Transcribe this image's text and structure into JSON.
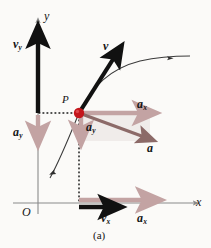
{
  "figure": {
    "caption": "(a)",
    "background_color": "#fbfaf8",
    "width": 211,
    "height": 248
  },
  "colors": {
    "axis": "#8a8a8a",
    "velocity_vector": "#111111",
    "acceleration_component": "#c3a3a3",
    "acceleration_resultant": "#8c6a68",
    "point_marker": "#c4161c",
    "shaded_region": "#f0ecea",
    "trajectory": "#3a3a3a",
    "dotted_guide": "#1a1a1a",
    "label_text": "#141414"
  },
  "axes": {
    "x_label": "x",
    "y_label": "y",
    "origin_label": "O"
  },
  "point": {
    "label": "P",
    "marker_name": "particle-position-dot"
  },
  "vectors": {
    "v": {
      "label": "v",
      "description": "velocity vector at P",
      "color": "#111111"
    },
    "v_y": {
      "label": "v",
      "subscript": "y",
      "description": "y component of velocity on y-axis",
      "color": "#111111"
    },
    "v_x": {
      "label": "v",
      "subscript": "x",
      "description": "x component of velocity on x-axis",
      "color": "#111111"
    },
    "a": {
      "label": "a",
      "description": "acceleration vector at P",
      "color": "#8c6a68"
    },
    "a_x_at_p": {
      "label": "a",
      "subscript": "x",
      "description": "x component of acceleration at P",
      "color": "#c3a3a3"
    },
    "a_y_at_p": {
      "label": "a",
      "subscript": "y",
      "description": "y component of acceleration at P",
      "color": "#c3a3a3"
    },
    "a_y_axis": {
      "label": "a",
      "subscript": "y",
      "description": "y component of acceleration on y-axis",
      "color": "#c3a3a3"
    },
    "a_x_axis": {
      "label": "a",
      "subscript": "x",
      "description": "x component of acceleration on x-axis",
      "color": "#c3a3a3"
    }
  },
  "trajectory": {
    "name": "particle-path",
    "description": "curved path of the particle through P"
  }
}
